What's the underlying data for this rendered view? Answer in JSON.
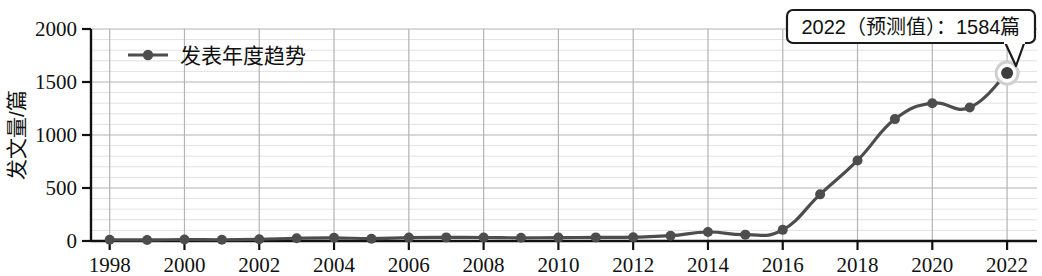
{
  "chart_data": {
    "type": "line",
    "title": "",
    "xlabel": "",
    "ylabel": "发文量/篇",
    "x": [
      1998,
      1999,
      2000,
      2001,
      2002,
      2003,
      2004,
      2005,
      2006,
      2007,
      2008,
      2009,
      2010,
      2011,
      2012,
      2013,
      2014,
      2015,
      2016,
      2017,
      2018,
      2019,
      2020,
      2021,
      2022
    ],
    "xlim": [
      1997.5,
      2022.8
    ],
    "ylim": [
      0,
      2000
    ],
    "xtick_labels": [
      "1998",
      "2000",
      "2002",
      "2004",
      "2006",
      "2008",
      "2010",
      "2012",
      "2014",
      "2016",
      "2018",
      "2020",
      "2022"
    ],
    "xtick_values": [
      1998,
      2000,
      2002,
      2004,
      2006,
      2008,
      2010,
      2012,
      2014,
      2016,
      2018,
      2020,
      2022
    ],
    "ytick_labels": [
      "0",
      "500",
      "1000",
      "1500",
      "2000"
    ],
    "ytick_values": [
      0,
      500,
      1000,
      1500,
      2000
    ],
    "grid": "major and minor horizontal, major vertical",
    "minor_y_step": 100,
    "legend_position": "top-left inside",
    "series": [
      {
        "name": "发表年度趋势",
        "color": "#4d4d4d",
        "marker": "circle",
        "values": [
          12,
          10,
          14,
          12,
          16,
          26,
          30,
          22,
          32,
          34,
          33,
          30,
          32,
          34,
          36,
          50,
          85,
          60,
          105,
          440,
          760,
          1150,
          1300,
          1260,
          1584
        ]
      }
    ],
    "annotations": [
      {
        "text": "2022（预测值）：1584篇",
        "x": 2022,
        "y": 1584,
        "highlight_point": true
      }
    ]
  },
  "legend": {
    "entries": [
      {
        "label": "发表年度趋势"
      }
    ]
  },
  "annotation": {
    "text": "2022（预测值）：1584篇"
  },
  "axes": {
    "y_title": "发文量/篇"
  }
}
